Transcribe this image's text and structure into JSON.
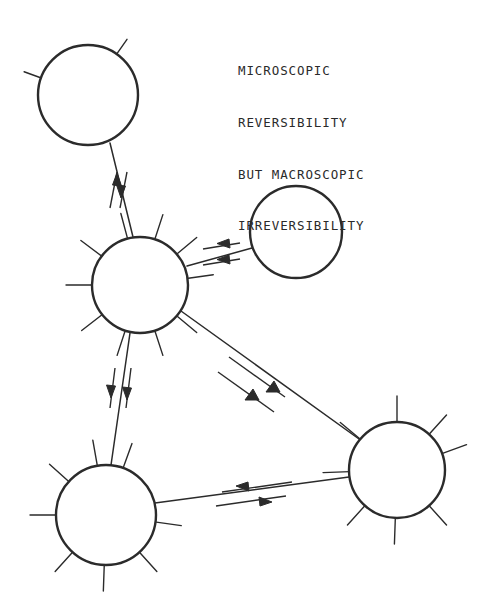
{
  "figure": {
    "name": "microscopic-reversibility-diagram",
    "background_color": "#ffffff",
    "stroke_color": "#2b2b2b",
    "width": 490,
    "height": 611
  },
  "caption": {
    "lines": [
      "MICROSCOPIC",
      "REVERSIBILITY",
      "BUT MACROSCOPIC",
      "IRREVERSIBILITY"
    ],
    "line_1": "MICROSCOPIC",
    "line_2": "REVERSIBILITY",
    "line_3": "BUT MACROSCOPIC",
    "line_4": "IRREVERSIBILITY",
    "x": 238,
    "y": 28
  },
  "nodes": [
    {
      "id": "node-top-left",
      "label": "top-left-circle",
      "cx": 88,
      "cy": 95,
      "r": 50,
      "spokes_deg": [
        55,
        160
      ],
      "spoke_len": 18
    },
    {
      "id": "node-center",
      "label": "center-circle",
      "cx": 140,
      "cy": 285,
      "r": 48,
      "spokes_deg": [
        8,
        40,
        72,
        105,
        143,
        180,
        218,
        252,
        288,
        320
      ],
      "spoke_len": 26
    },
    {
      "id": "node-upper-right",
      "label": "upper-right-circle",
      "cx": 296,
      "cy": 232,
      "r": 46,
      "spokes_deg": [],
      "spoke_len": 0
    },
    {
      "id": "node-lower-right",
      "label": "lower-right-circle",
      "cx": 397,
      "cy": 470,
      "r": 48,
      "spokes_deg": [
        20,
        48,
        90,
        140,
        182,
        228,
        268,
        312
      ],
      "spoke_len": 26
    },
    {
      "id": "node-lower-left",
      "label": "lower-left-circle",
      "cx": 106,
      "cy": 515,
      "r": 50,
      "spokes_deg": [
        70,
        100,
        138,
        180,
        228,
        268,
        312,
        352
      ],
      "spoke_len": 26
    }
  ],
  "edges": [
    {
      "id": "edge-topleft-center",
      "from": "node-top-left",
      "to": "node-center",
      "arrow_pair": "up-down",
      "arrow_count": 2
    },
    {
      "id": "edge-center-upperright",
      "from": "node-center",
      "to": "node-upper-right",
      "arrow_pair": "both-right",
      "arrow_count": 2
    },
    {
      "id": "edge-center-lowerright",
      "from": "node-center",
      "to": "node-lower-right",
      "arrow_pair": "both-down-right",
      "arrow_count": 2
    },
    {
      "id": "edge-center-lowerleft",
      "from": "node-center",
      "to": "node-lower-left",
      "arrow_pair": "both-down",
      "arrow_count": 2
    },
    {
      "id": "edge-lowerleft-lowerright",
      "from": "node-lower-left",
      "to": "node-lower-right",
      "arrow_pair": "left-right",
      "arrow_count": 2
    }
  ]
}
